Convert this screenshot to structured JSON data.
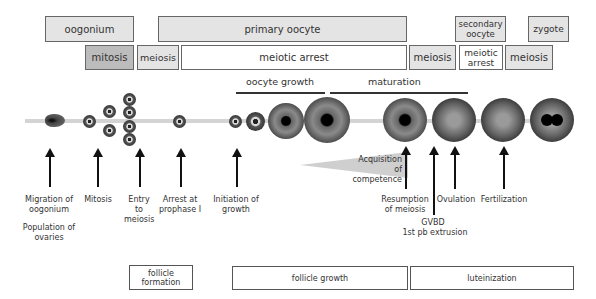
{
  "stage_row": {
    "oogonium": "oogonium",
    "primary_oocyte": "primary oocyte",
    "secondary_oocyte": "secondary oocyte",
    "zygote": "zygote"
  },
  "division_row": {
    "mitosis": "mitosis",
    "meiosis_1": "meiosis",
    "meiotic_arrest_1": "meiotic arrest",
    "meiosis_2": "meiosis",
    "meiotic_arrest_2": "meiotic arrest",
    "meiosis_3": "meiosis"
  },
  "phases": {
    "oocyte_growth": "oocyte growth",
    "maturation": "maturation"
  },
  "wedge_label": "Acquisition of competence",
  "events": [
    {
      "label": "Migration of oogonium"
    },
    {
      "label": "Mitosis"
    },
    {
      "label": "Entry to meiosis"
    },
    {
      "label": "Arrest at prophase I"
    },
    {
      "label": "Initiation of growth"
    },
    {
      "label": "Resumption of meiosis"
    },
    {
      "label": "Ovulation"
    },
    {
      "label": "Fertilization"
    }
  ],
  "sub_labels": {
    "population": "Population of ovaries",
    "gvbd": "GVBD",
    "pb_extrusion": "1st pb extrusion"
  },
  "follicle_row": {
    "formation": "follicle formation",
    "growth": "follicle growth",
    "luteinization": "luteinization"
  }
}
